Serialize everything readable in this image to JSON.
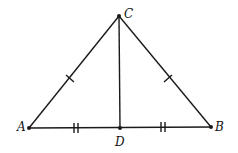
{
  "diagram": {
    "type": "isosceles-triangle-with-median",
    "points": {
      "A": {
        "label": "A",
        "x": 29,
        "y": 128
      },
      "B": {
        "label": "B",
        "x": 211,
        "y": 127
      },
      "C": {
        "label": "C",
        "x": 119,
        "y": 16
      },
      "D": {
        "label": "D",
        "x": 120,
        "y": 128
      }
    },
    "segments": [
      "AC",
      "BC",
      "AB",
      "CD"
    ],
    "tick_marks": {
      "AC": 1,
      "BC": 1,
      "AD": 2,
      "DB": 2
    },
    "stroke_color": "#1a1a1a"
  }
}
